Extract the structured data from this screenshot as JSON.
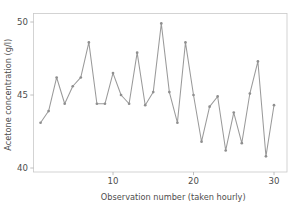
{
  "chart_data": {
    "type": "line",
    "title": "",
    "xlabel": "Observation number (taken hourly)",
    "ylabel": "Acetone concentration (g/l)",
    "xlim": [
      1.0,
      31.0
    ],
    "ylim": [
      39.3,
      50.4
    ],
    "xticks": [
      10,
      20,
      30
    ],
    "yticks": [
      40,
      45,
      50
    ],
    "xtick_labels": [
      "10",
      "20",
      "30"
    ],
    "ytick_labels": [
      "40",
      "45",
      "50"
    ],
    "grid": false,
    "legend": false,
    "legend_position": "none",
    "marker": "filled-circle",
    "line_color": "#9a9a9a",
    "marker_color": "#8f8f8f",
    "axis_color": "#c9c9c9",
    "text_color": "#4d4d4d",
    "background": "#ffffff",
    "x": [
      1,
      2,
      3,
      4,
      5,
      6,
      7,
      8,
      9,
      10,
      11,
      12,
      13,
      14,
      15,
      16,
      17,
      18,
      19,
      20,
      21,
      22,
      23,
      24,
      25,
      26,
      27,
      28,
      29,
      30
    ],
    "values": [
      43.1,
      43.9,
      46.2,
      44.4,
      45.6,
      46.2,
      48.6,
      44.4,
      44.4,
      46.5,
      45.0,
      44.4,
      47.9,
      44.3,
      45.2,
      49.9,
      45.2,
      43.1,
      48.6,
      45.0,
      41.8,
      44.2,
      44.9,
      41.2,
      43.8,
      41.7,
      45.1,
      47.3,
      40.8,
      44.3
    ],
    "series": [
      {
        "name": "Acetone concentration",
        "values": [
          43.1,
          43.9,
          46.2,
          44.4,
          45.6,
          46.2,
          48.6,
          44.4,
          44.4,
          46.5,
          45.0,
          44.4,
          47.9,
          44.3,
          45.2,
          49.9,
          45.2,
          43.1,
          48.6,
          45.0,
          41.8,
          44.2,
          44.9,
          41.2,
          43.8,
          41.7,
          45.1,
          47.3,
          40.8,
          44.3
        ]
      }
    ]
  }
}
